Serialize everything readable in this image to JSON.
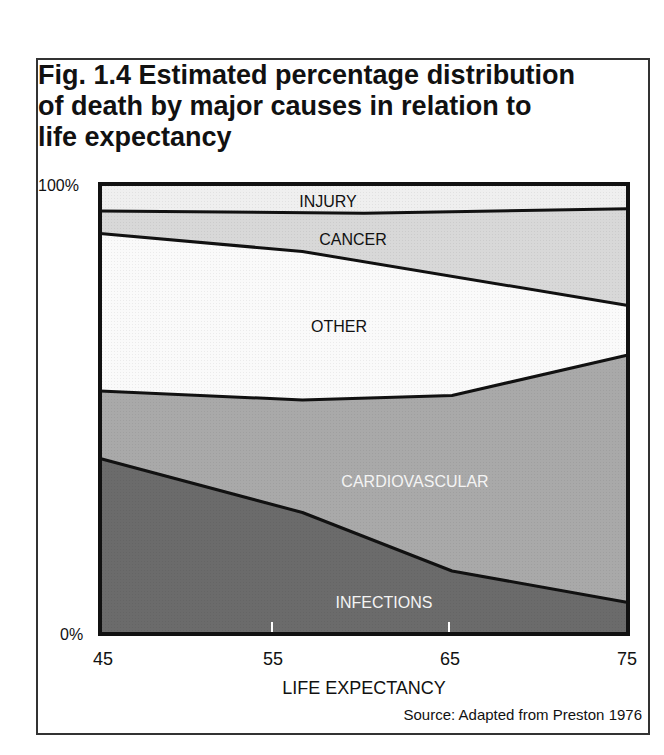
{
  "figure": {
    "title": "Fig. 1.4  Estimated percentage distribution of death by major causes in relation to life expectancy",
    "title_lines": [
      "Fig. 1.4  Estimated percentage distribution",
      "of death by major causes in relation to",
      "life expectancy"
    ],
    "source": "Source: Adapted from Preston 1976"
  },
  "chart_data": {
    "type": "area",
    "stacked": true,
    "title": "Fig. 1.4 Estimated percentage distribution of death by major causes in relation to life expectancy",
    "xlabel": "LIFE EXPECTANCY",
    "ylabel": "",
    "x_ticks": [
      "45",
      "55",
      "65",
      "75"
    ],
    "y_ticks": [
      "0%",
      "100%"
    ],
    "xlim": [
      45,
      75
    ],
    "ylim": [
      0,
      100
    ],
    "grid": false,
    "legend": "inline labels",
    "boundaries_cumulative_percent": {
      "infections_top": [
        [
          45,
          39
        ],
        [
          56.5,
          27
        ],
        [
          65,
          14
        ],
        [
          75,
          7
        ]
      ],
      "cardiovascular_top": [
        [
          45,
          54
        ],
        [
          56.5,
          52
        ],
        [
          65,
          53
        ],
        [
          75,
          62
        ]
      ],
      "other_top": [
        [
          45,
          89
        ],
        [
          56.5,
          85
        ],
        [
          75,
          73
        ]
      ],
      "cancer_top": [
        [
          45,
          94
        ],
        [
          60,
          93.5
        ],
        [
          75,
          94.5
        ]
      ],
      "injury_top": [
        [
          45,
          100
        ],
        [
          75,
          100
        ]
      ]
    },
    "x": [
      45,
      55,
      65,
      75
    ],
    "series": [
      {
        "name": "INFECTIONS",
        "values": [
          39,
          29,
          14,
          7
        ],
        "color": "#6b6b6b"
      },
      {
        "name": "CARDIOVASCULAR",
        "values": [
          15,
          23,
          39,
          55
        ],
        "color": "#a9a9a9"
      },
      {
        "name": "OTHER",
        "values": [
          35,
          33,
          26,
          11
        ],
        "color": "#fafafa"
      },
      {
        "name": "CANCER",
        "values": [
          5,
          8.5,
          14.5,
          21.5
        ],
        "color": "#d8d8d8"
      },
      {
        "name": "INJURY",
        "values": [
          6,
          6.5,
          6.5,
          5.5
        ],
        "color": "#efefef"
      }
    ],
    "labels": {
      "injury": "INJURY",
      "cancer": "CANCER",
      "other": "OTHER",
      "cardiovascular": "CARDIOVASCULAR",
      "infections": "INFECTIONS"
    },
    "source": "Source: Adapted from Preston 1976"
  }
}
